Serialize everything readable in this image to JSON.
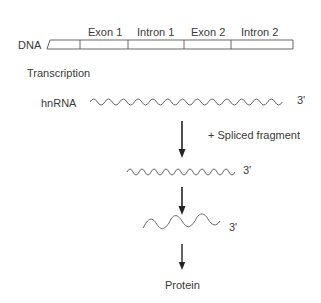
{
  "dna": {
    "label": "DNA",
    "segments": [
      {
        "label": "Exon 1"
      },
      {
        "label": "Intron 1"
      },
      {
        "label": "Exon 2"
      },
      {
        "label": "Intron 2"
      }
    ]
  },
  "steps": {
    "transcription": "Transcription",
    "hnrna_label": "hnRNA",
    "hnrna_end": "3'",
    "splice_note": "+ Spliced fragment",
    "mrna1_end": "3'",
    "mrna2_end": "3'",
    "product": "Protein"
  },
  "colors": {
    "line": "#555555",
    "arrow": "#222222",
    "text": "#3a3a3a"
  }
}
